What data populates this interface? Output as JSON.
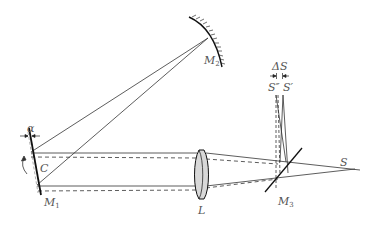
{
  "diagram": {
    "type": "optical-setup",
    "labels": {
      "alpha": "α",
      "C": "C",
      "M1": "M",
      "M1_sub": "1",
      "M2": "M",
      "M2_sub": "2",
      "M3": "M",
      "M3_sub": "3",
      "L": "L",
      "S": "S",
      "S_double_prime": "S″",
      "S_prime": "S′",
      "delta_S": "ΔS"
    },
    "elements": [
      {
        "id": "M1",
        "kind": "rotating plane mirror"
      },
      {
        "id": "M2",
        "kind": "concave mirror"
      },
      {
        "id": "M3",
        "kind": "beam splitter"
      },
      {
        "id": "L",
        "kind": "lens"
      },
      {
        "id": "S",
        "kind": "source"
      },
      {
        "id": "S_prime",
        "kind": "image"
      },
      {
        "id": "S_double_prime",
        "kind": "displaced image"
      }
    ],
    "colors": {
      "line": "#222222",
      "label": "#555555",
      "lens_fill": "#d8d8d8"
    }
  }
}
